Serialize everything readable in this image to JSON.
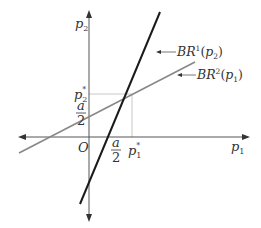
{
  "diagram": {
    "type": "best-response-functions",
    "axes": {
      "x_label": "p",
      "x_label_sub": "1",
      "y_label": "p",
      "y_label_sub": "2",
      "origin_label": "O"
    },
    "curves": [
      {
        "name": "BR1",
        "label_main": "BR",
        "label_sup": "1",
        "label_arg": "p",
        "label_arg_sub": "2",
        "color": "#1a1a1a"
      },
      {
        "name": "BR2",
        "label_main": "BR",
        "label_sup": "2",
        "label_arg": "p",
        "label_arg_sub": "1",
        "color": "#888888"
      }
    ],
    "equilibrium": {
      "x_label": "p",
      "x_label_sub": "1",
      "x_label_sup": "*",
      "y_label": "p",
      "y_label_sub": "2",
      "y_label_sup": "*"
    },
    "intercepts": {
      "x_intercept_num": "a",
      "x_intercept_den": "2",
      "y_intercept_num": "a",
      "y_intercept_den": "2"
    }
  }
}
